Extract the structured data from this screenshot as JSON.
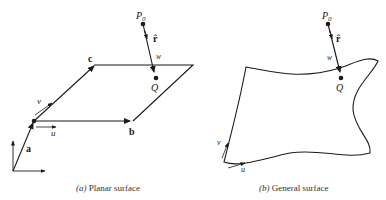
{
  "panels": [
    {
      "id": "a",
      "caption_letter": "(a)",
      "caption_text": " Planar surface",
      "labels": {
        "p0": "P",
        "p0_sub": "0",
        "r_hat": "r̂",
        "w": "w",
        "q": "Q",
        "a": "a",
        "b": "b",
        "c": "c",
        "u": "u",
        "v": "v"
      }
    },
    {
      "id": "b",
      "caption_letter": "(b)",
      "caption_text": " General surface",
      "labels": {
        "p0": "P",
        "p0_sub": "0",
        "r_hat": "r̂",
        "w": "w",
        "q": "Q",
        "u": "u",
        "v": "v"
      }
    }
  ],
  "colors": {
    "stroke": "#1a1a1a",
    "background": "#ffffff"
  }
}
